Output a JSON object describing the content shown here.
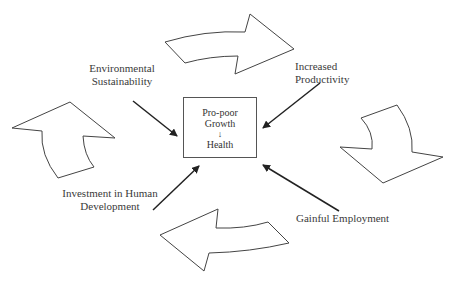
{
  "diagram": {
    "center_box": {
      "line1": "Pro-poor",
      "line2": "Growth",
      "arrow": "↓",
      "line3": "Health"
    },
    "factors": [
      {
        "id": "environmental",
        "line1": "Environmental",
        "line2": "Sustainability"
      },
      {
        "id": "productivity",
        "line1": "Increased",
        "line2": "Productivity"
      },
      {
        "id": "human-development",
        "line1": "Investment in Human",
        "line2": "Development"
      },
      {
        "id": "employment",
        "line1": "Gainful Employment",
        "line2": ""
      }
    ],
    "cycle_arrows": [
      "top-right-arrow",
      "right-down-arrow",
      "bottom-left-arrow",
      "left-up-arrow"
    ],
    "colors": {
      "stroke": "#444444",
      "text": "#333333",
      "background": "#ffffff"
    }
  }
}
